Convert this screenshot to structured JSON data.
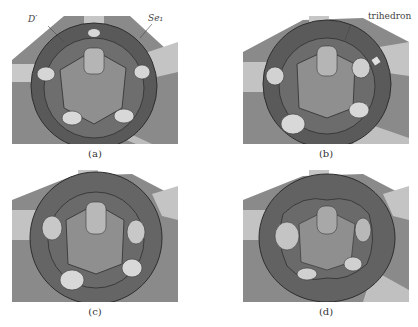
{
  "figure": {
    "panels": [
      {
        "id": "a",
        "caption": "(a)",
        "annotations": [
          {
            "text": "D′"
          },
          {
            "text": "Se₁"
          }
        ]
      },
      {
        "id": "b",
        "caption": "(b)",
        "annotations": [
          {
            "text": "trihedron"
          }
        ]
      },
      {
        "id": "c",
        "caption": "(c)",
        "annotations": []
      },
      {
        "id": "d",
        "caption": "(d)",
        "annotations": []
      }
    ],
    "colors": {
      "background": "#ffffff",
      "base_plate": "#8a8a8a",
      "ring_dark": "#555555",
      "ring_mid": "#707070",
      "inner_floor": "#8e8e8e",
      "pillar": "#c8c8c8",
      "arm": "#bdbdbd",
      "edge": "#2e2e2e"
    }
  }
}
